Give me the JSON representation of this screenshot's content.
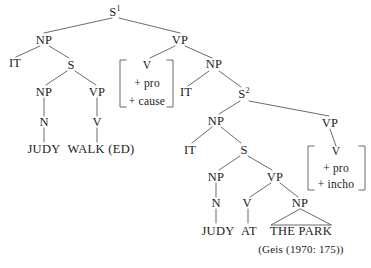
{
  "figure": {
    "type": "syntax-tree-diagram",
    "citation": "(Geis (1970: 175))",
    "line_color": "#5a5a52",
    "text_color": "#1c1c1c",
    "background": "#ffffff"
  },
  "nodes": {
    "s1": {
      "label": "S",
      "sup": "1"
    },
    "np_left": {
      "label": "NP"
    },
    "vp_top": {
      "label": "VP"
    },
    "it_1": {
      "label": "IT"
    },
    "s_left": {
      "label": "S"
    },
    "np_left2": {
      "label": "NP"
    },
    "vp_left2": {
      "label": "VP"
    },
    "n_left": {
      "label": "N"
    },
    "v_left": {
      "label": "V"
    },
    "judy_left": {
      "label": "JUDY"
    },
    "walked": {
      "label": "WALK (ED)"
    },
    "np_mid": {
      "label": "NP"
    },
    "it_2": {
      "label": "IT"
    },
    "s2": {
      "label": "S",
      "sup": "2"
    },
    "np_s2": {
      "label": "NP"
    },
    "vp_s2": {
      "label": "VP"
    },
    "it_3": {
      "label": "IT"
    },
    "s_inner": {
      "label": "S"
    },
    "np_inner": {
      "label": "NP"
    },
    "vp_inner": {
      "label": "VP"
    },
    "n_inner": {
      "label": "N"
    },
    "v_inner": {
      "label": "V"
    },
    "np_pp": {
      "label": "NP"
    },
    "judy_right": {
      "label": "JUDY"
    },
    "at": {
      "label": "AT"
    },
    "the_park": {
      "label": "THE PARK"
    }
  },
  "feature_matrix_1": {
    "lines": [
      "V",
      "+ pro",
      "+ cause"
    ]
  },
  "feature_matrix_2": {
    "lines": [
      "V",
      "+ pro",
      "+ incho"
    ]
  }
}
